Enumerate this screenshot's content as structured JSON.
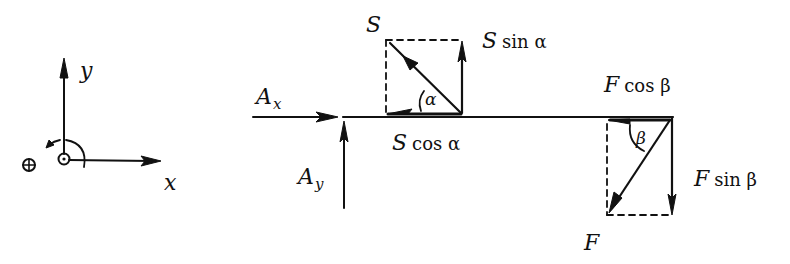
{
  "diagram": {
    "type": "free-body-diagram",
    "colors": {
      "ink": "#111111",
      "background": "#ffffff"
    },
    "coordinate_system": {
      "x_axis_label": "x",
      "y_axis_label": "y",
      "positive_rotation_symbol": "⊕",
      "origin_symbol": "⊙",
      "rotation_direction": "counterclockwise"
    },
    "support_reactions": {
      "horizontal": {
        "symbol": "A",
        "subscript": "x"
      },
      "vertical": {
        "symbol": "A",
        "subscript": "y"
      }
    },
    "force_S": {
      "label": "S",
      "angle_label": "α",
      "horizontal_component": {
        "symbol": "S",
        "fn": "cos α"
      },
      "vertical_component": {
        "symbol": "S",
        "fn": "sin α"
      }
    },
    "force_F": {
      "label": "F",
      "angle_label": "β",
      "horizontal_component": {
        "symbol": "F",
        "fn": "cos β"
      },
      "vertical_component": {
        "symbol": "F",
        "fn": "sin β"
      }
    }
  }
}
